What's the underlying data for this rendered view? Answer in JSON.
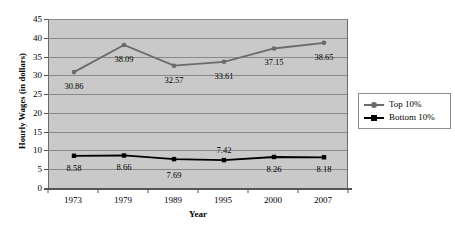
{
  "chart_data": {
    "type": "line",
    "title": "",
    "xlabel": "Year",
    "ylabel": "Hourly Wages (in dollars)",
    "categories": [
      "1973",
      "1979",
      "1989",
      "1995",
      "2000",
      "2007"
    ],
    "ylim": [
      0,
      45
    ],
    "ytick_step": 5,
    "yticks": [
      "45",
      "40",
      "35",
      "30",
      "25",
      "20",
      "15",
      "10",
      "5",
      "0"
    ],
    "grid": true,
    "legend_position": "right",
    "plot_background": "#c9c9c9",
    "series": [
      {
        "name": "Top 10%",
        "color": "#6b6b6b",
        "marker": "circle",
        "values": [
          30.86,
          38.09,
          32.57,
          33.61,
          37.15,
          38.65
        ],
        "labels": [
          "30.86",
          "38.09",
          "32.57",
          "33.61",
          "37.15",
          "38.65"
        ]
      },
      {
        "name": "Bottom 10%",
        "color": "#000000",
        "marker": "square",
        "values": [
          8.58,
          8.66,
          7.69,
          7.42,
          8.26,
          8.18
        ],
        "labels": [
          "8.58",
          "8.66",
          "7.69",
          "7.42",
          "8.26",
          "8.18"
        ]
      }
    ]
  },
  "legend": {
    "entries": [
      {
        "label": "Top 10%"
      },
      {
        "label": "Bottom 10%"
      }
    ]
  }
}
